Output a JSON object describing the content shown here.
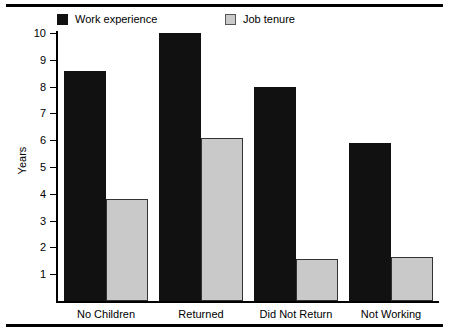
{
  "chart_data": {
    "type": "bar",
    "title": "",
    "xlabel": "",
    "ylabel": "Years",
    "ylim": [
      0,
      10
    ],
    "ytick_values": [
      1,
      2,
      3,
      4,
      5,
      6,
      7,
      8,
      9,
      10
    ],
    "ytick_labels": [
      "1",
      "2",
      "3",
      "4",
      "5",
      "6",
      "7",
      "8",
      "9",
      "10"
    ],
    "grid": false,
    "legend_position": "top",
    "categories": [
      "No Children",
      "Returned",
      "Did Not Return",
      "Not Working"
    ],
    "series": [
      {
        "name": "Work experience",
        "color": "#111111",
        "values": [
          8.6,
          10.0,
          8.0,
          5.9
        ]
      },
      {
        "name": "Job tenure",
        "color": "#c9c9c9",
        "values": [
          3.8,
          6.1,
          1.55,
          1.65
        ]
      }
    ]
  },
  "legend": {
    "entries": [
      {
        "label": "Work experience",
        "swatch": "dark"
      },
      {
        "label": "Job tenure",
        "swatch": "light"
      }
    ]
  },
  "axes": {
    "y_axis_label": "Years"
  }
}
